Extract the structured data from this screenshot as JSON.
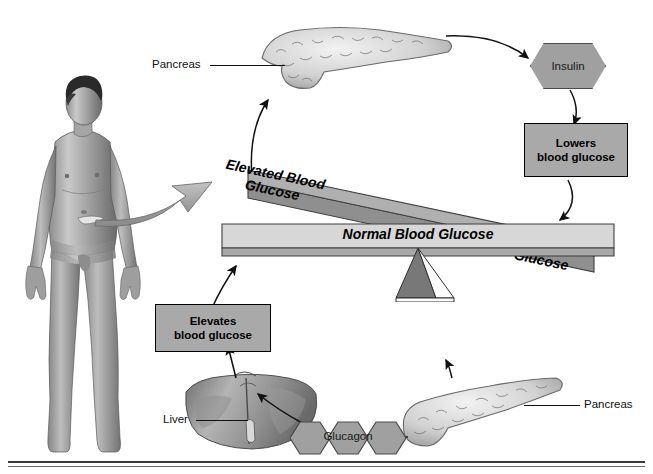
{
  "diagram": {
    "background_color": "#ffffff",
    "box_fill": "#a9a9a9",
    "hex_fill": "#a0a0a0",
    "beam_dark_fill": "#9a9a9a",
    "beam_light_fill": "#d4d4d4",
    "line_color": "#111111"
  },
  "labels": {
    "pancreas_top": "Pancreas",
    "pancreas_bottom": "Pancreas",
    "liver": "Liver"
  },
  "hormones": {
    "insulin": "Insulin",
    "glucagon": "Glucagon"
  },
  "boxes": {
    "lowers": "Lowers\nblood glucose",
    "elevates": "Elevates\nblood glucose"
  },
  "beams": {
    "elevated": "Elevated Blood\nGlucose",
    "normal": "Normal Blood Glucose",
    "low": "Low Blood\nGlucose"
  }
}
